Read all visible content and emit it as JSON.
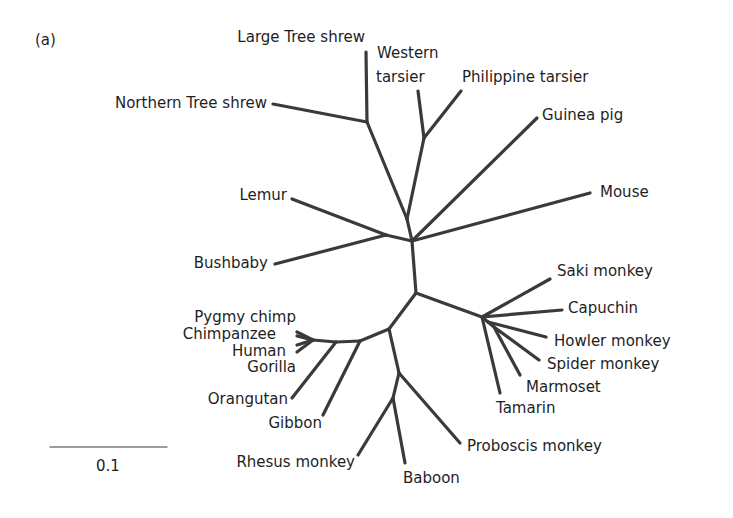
{
  "figure": {
    "panel_label": "(a)",
    "type": "unrooted phylogenetic tree",
    "scale_bar": {
      "label": "0.1",
      "x1": 50,
      "x2": 167,
      "y": 447
    }
  },
  "nodes": {
    "root": [
      412,
      241
    ],
    "upper": [
      407,
      219
    ],
    "shrew": [
      367,
      122
    ],
    "tarsier": [
      424,
      138
    ],
    "strep": [
      386,
      235
    ],
    "lower": [
      416,
      293
    ],
    "nwm": [
      482,
      317
    ],
    "nwm2": [
      488,
      322
    ],
    "nwm3": [
      494,
      327
    ],
    "catarrhine": [
      389,
      329
    ],
    "ape1": [
      360,
      341
    ],
    "ape2": [
      336,
      342
    ],
    "great": [
      313,
      340
    ],
    "owm": [
      399,
      373
    ],
    "owm2": [
      393,
      398
    ]
  },
  "edges": [
    [
      "root",
      "upper"
    ],
    [
      "upper",
      "shrew"
    ],
    [
      "upper",
      "tarsier"
    ],
    [
      "root",
      "strep"
    ],
    [
      "root",
      "lower"
    ],
    [
      "lower",
      "nwm"
    ],
    [
      "nwm",
      "nwm2"
    ],
    [
      "nwm2",
      "nwm3"
    ],
    [
      "lower",
      "catarrhine"
    ],
    [
      "catarrhine",
      "ape1"
    ],
    [
      "ape1",
      "ape2"
    ],
    [
      "ape2",
      "great"
    ],
    [
      "catarrhine",
      "owm"
    ],
    [
      "owm",
      "owm2"
    ]
  ],
  "leaves": [
    {
      "name": "Large Tree shrew",
      "from": "shrew",
      "tip": [
        366,
        52
      ],
      "label_x": 365,
      "label_y": 42,
      "anchor": "end"
    },
    {
      "name": "Northern Tree shrew",
      "from": "shrew",
      "tip": [
        273,
        104
      ],
      "label_x": 267,
      "label_y": 108,
      "anchor": "end"
    },
    {
      "name": "Western",
      "from": null,
      "tip": null,
      "label_x": 377,
      "label_y": 58,
      "anchor": "start"
    },
    {
      "name": "tarsier",
      "from": "tarsier",
      "tip": [
        418,
        91
      ],
      "label_x": 376,
      "label_y": 82,
      "anchor": "start"
    },
    {
      "name": "Philippine tarsier",
      "from": "tarsier",
      "tip": [
        461,
        91
      ],
      "label_x": 462,
      "label_y": 82,
      "anchor": "start"
    },
    {
      "name": "Guinea pig",
      "from": "root",
      "tip": [
        537,
        118
      ],
      "label_x": 542,
      "label_y": 120,
      "anchor": "start"
    },
    {
      "name": "Mouse",
      "from": "root",
      "tip": [
        590,
        193
      ],
      "label_x": 600,
      "label_y": 197,
      "anchor": "start"
    },
    {
      "name": "Lemur",
      "from": "strep",
      "tip": [
        292,
        199
      ],
      "label_x": 287,
      "label_y": 200,
      "anchor": "end"
    },
    {
      "name": "Bushbaby",
      "from": "strep",
      "tip": [
        275,
        264
      ],
      "label_x": 268,
      "label_y": 268,
      "anchor": "end"
    },
    {
      "name": "Saki monkey",
      "from": "nwm",
      "tip": [
        550,
        279
      ],
      "label_x": 557,
      "label_y": 276,
      "anchor": "start"
    },
    {
      "name": "Capuchin",
      "from": "nwm",
      "tip": [
        562,
        310
      ],
      "label_x": 568,
      "label_y": 313,
      "anchor": "start"
    },
    {
      "name": "Howler monkey",
      "from": "nwm2",
      "tip": [
        546,
        337
      ],
      "label_x": 554,
      "label_y": 346,
      "anchor": "start"
    },
    {
      "name": "Spider monkey",
      "from": "nwm3",
      "tip": [
        539,
        360
      ],
      "label_x": 547,
      "label_y": 369,
      "anchor": "start"
    },
    {
      "name": "Marmoset",
      "from": "nwm3",
      "tip": [
        520,
        375
      ],
      "label_x": 526,
      "label_y": 392,
      "anchor": "start"
    },
    {
      "name": "Tamarin",
      "from": "nwm",
      "tip": [
        500,
        393
      ],
      "label_x": 496,
      "label_y": 413,
      "anchor": "start"
    },
    {
      "name": "Pygmy chimp",
      "from": "great",
      "tip": [
        297,
        336
      ],
      "label_x": 296,
      "label_y": 322,
      "anchor": "end"
    },
    {
      "name": "Chimpanzee",
      "from": "great",
      "tip": [
        297,
        332
      ],
      "label_x": 276,
      "label_y": 339,
      "anchor": "end"
    },
    {
      "name": "Human",
      "from": "great",
      "tip": [
        297,
        345
      ],
      "label_x": 286,
      "label_y": 356,
      "anchor": "end"
    },
    {
      "name": "Gorilla",
      "from": "great",
      "tip": [
        297,
        352
      ],
      "label_x": 296,
      "label_y": 372,
      "anchor": "end"
    },
    {
      "name": "Orangutan",
      "from": "ape2",
      "tip": [
        292,
        398
      ],
      "label_x": 288,
      "label_y": 404,
      "anchor": "end"
    },
    {
      "name": "Gibbon",
      "from": "ape1",
      "tip": [
        323,
        415
      ],
      "label_x": 322,
      "label_y": 428,
      "anchor": "end"
    },
    {
      "name": "Rhesus monkey",
      "from": "owm2",
      "tip": [
        358,
        455
      ],
      "label_x": 355,
      "label_y": 467,
      "anchor": "end"
    },
    {
      "name": "Baboon",
      "from": "owm2",
      "tip": [
        405,
        463
      ],
      "label_x": 403,
      "label_y": 483,
      "anchor": "start"
    },
    {
      "name": "Proboscis monkey",
      "from": "owm",
      "tip": [
        460,
        443
      ],
      "label_x": 467,
      "label_y": 451,
      "anchor": "start"
    }
  ],
  "colors": {
    "branch": "#3a3a3a",
    "text": "#1e1e1e",
    "background": "#ffffff"
  }
}
